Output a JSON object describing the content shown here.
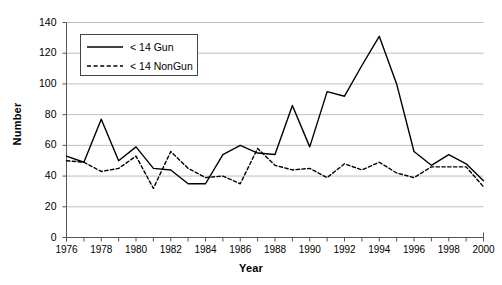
{
  "chart_data": {
    "type": "line",
    "title": "",
    "xlabel": "Year",
    "ylabel": "Number",
    "xlim": [
      1976,
      2000
    ],
    "ylim": [
      0,
      140
    ],
    "ytick_step": 20,
    "yticks": [
      0,
      20,
      40,
      60,
      80,
      100,
      120,
      140
    ],
    "xticks": [
      1976,
      1977,
      1978,
      1979,
      1980,
      1981,
      1982,
      1983,
      1984,
      1985,
      1986,
      1987,
      1988,
      1989,
      1990,
      1991,
      1992,
      1993,
      1994,
      1995,
      1996,
      1997,
      1998,
      1999,
      2000
    ],
    "xtick_labels": [
      "1976",
      "",
      "1978",
      "",
      "1980",
      "",
      "1982",
      "",
      "1984",
      "",
      "1986",
      "",
      "1988",
      "",
      "1990",
      "",
      "1992",
      "",
      "1994",
      "",
      "1996",
      "",
      "1998",
      "",
      "2000"
    ],
    "x": [
      1976,
      1977,
      1978,
      1979,
      1980,
      1981,
      1982,
      1983,
      1984,
      1985,
      1986,
      1987,
      1988,
      1989,
      1990,
      1991,
      1992,
      1993,
      1994,
      1995,
      1996,
      1997,
      1998,
      1999,
      2000
    ],
    "grid": "horizontal",
    "legend_position": "top-left",
    "series": [
      {
        "name": "< 14 Gun",
        "style": "solid",
        "color": "#000000",
        "values": [
          53,
          49,
          77,
          50,
          59,
          45,
          44,
          35,
          35,
          54,
          60,
          55,
          54,
          86,
          59,
          95,
          92,
          112,
          131,
          100,
          56,
          47,
          54,
          48,
          37
        ]
      },
      {
        "name": "< 14 NonGun",
        "style": "dashed",
        "color": "#000000",
        "values": [
          50,
          49,
          43,
          45,
          53,
          32,
          56,
          45,
          39,
          40,
          35,
          58,
          47,
          44,
          45,
          39,
          48,
          44,
          49,
          42,
          39,
          46,
          46,
          46,
          33
        ]
      }
    ]
  },
  "legend": {
    "items": [
      {
        "label": "< 14 Gun"
      },
      {
        "label": "< 14 NonGun"
      }
    ]
  },
  "axes": {
    "y_title": "Number",
    "x_title": "Year"
  },
  "colors": {
    "line": "#000000",
    "grid": "#bfbfbf",
    "axis": "#555555",
    "background": "#ffffff"
  }
}
